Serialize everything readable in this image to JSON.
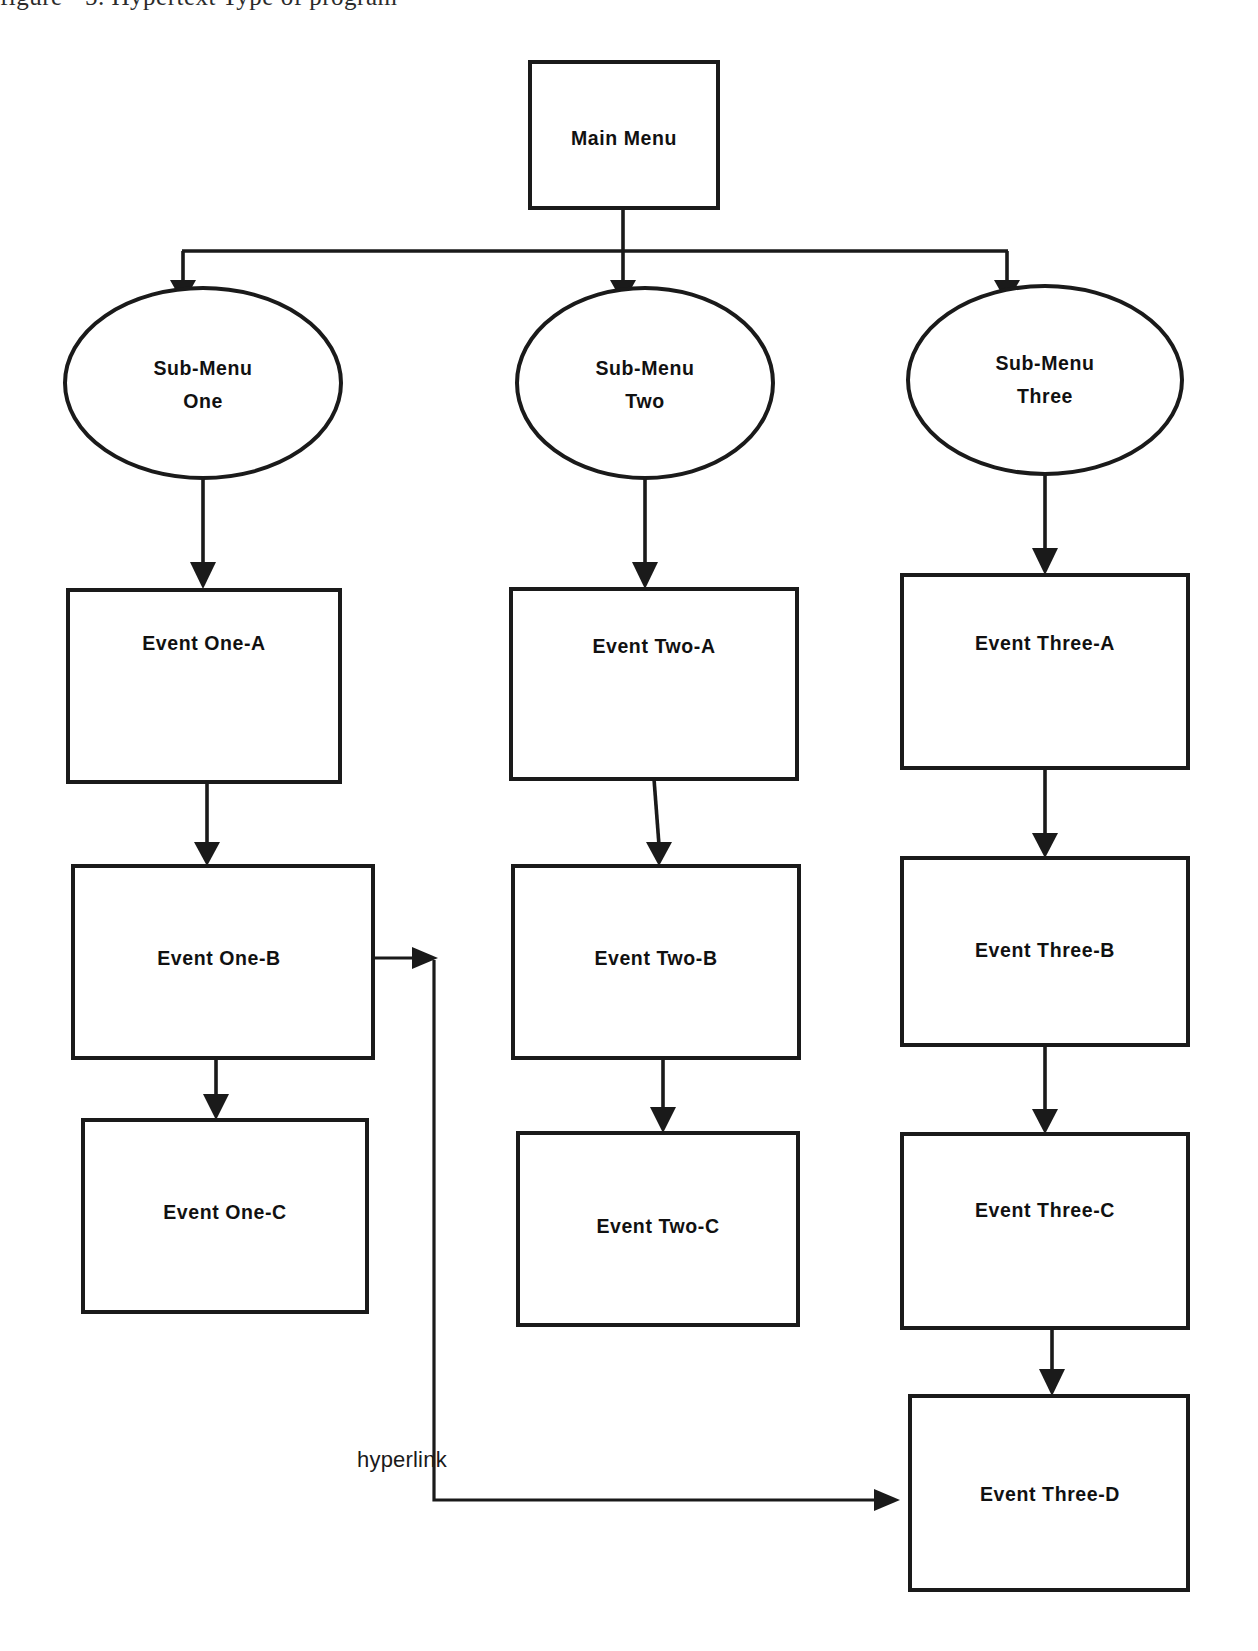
{
  "page": {
    "kind": "flowchart-diagram",
    "background_color": "#ffffff",
    "stroke_color": "#1a1a1a",
    "text_color": "#111111",
    "width": 1258,
    "height": 1651,
    "cropped_top_text": "figure - 5.  Hypertext Type of  program"
  },
  "nodes": {
    "main_menu": {
      "label": "Main Menu",
      "shape": "rectangle"
    },
    "sub_menu_one": {
      "label_line1": "Sub-Menu",
      "label_line2": "One",
      "shape": "ellipse"
    },
    "sub_menu_two": {
      "label_line1": "Sub-Menu",
      "label_line2": "Two",
      "shape": "ellipse"
    },
    "sub_menu_three": {
      "label_line1": "Sub-Menu",
      "label_line2": "Three",
      "shape": "ellipse"
    },
    "event_one_a": {
      "label": "Event One-A",
      "shape": "rectangle"
    },
    "event_one_b": {
      "label": "Event One-B",
      "shape": "rectangle"
    },
    "event_one_c": {
      "label": "Event One-C",
      "shape": "rectangle"
    },
    "event_two_a": {
      "label": "Event Two-A",
      "shape": "rectangle"
    },
    "event_two_b": {
      "label": "Event Two-B",
      "shape": "rectangle"
    },
    "event_two_c": {
      "label": "Event Two-C",
      "shape": "rectangle"
    },
    "event_three_a": {
      "label": "Event Three-A",
      "shape": "rectangle"
    },
    "event_three_b": {
      "label": "Event Three-B",
      "shape": "rectangle"
    },
    "event_three_c": {
      "label": "Event Three-C",
      "shape": "rectangle"
    },
    "event_three_d": {
      "label": "Event Three-D",
      "shape": "rectangle"
    }
  },
  "edges": {
    "hyperlink": {
      "label": "hyperlink",
      "from": "event_one_b",
      "to": "event_three_d"
    }
  }
}
